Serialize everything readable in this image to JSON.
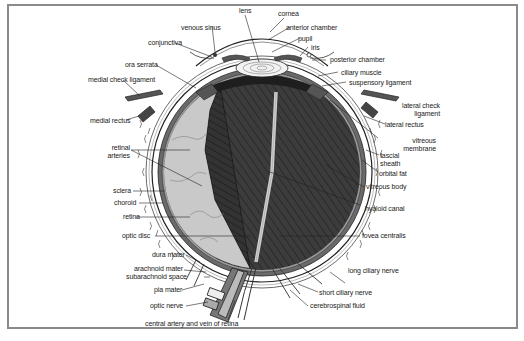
{
  "colors": {
    "frame": "#8a8a8a",
    "vitreous": "#3c3c3c",
    "sclera": "#ffffff",
    "choroid": "#6a6a6a",
    "retina": "#c8c8c8",
    "lens": "#ececec",
    "line": "#222222"
  },
  "labels": {
    "lens": "lens",
    "cornea": "cornea",
    "venous_sinus": "venous sinus",
    "anterior_chamber": "anterior chamber",
    "conjunctiva": "conjunctiva",
    "pupil": "pupil",
    "iris": "iris",
    "posterior_chamber": "posterior chamber",
    "ora_serrata": "ora serrata",
    "ciliary_muscle": "ciliary muscle",
    "medial_check_ligament": "medial check ligament",
    "suspensory_ligament": "suspensory ligament",
    "medial_rectus": "medial rectus",
    "lateral_check_ligament_1": "lateral check",
    "lateral_check_ligament_2": "ligament",
    "lateral_rectus": "lateral rectus",
    "retinal_arteries_1": "retinal",
    "retinal_arteries_2": "arteries",
    "vitreous_membrane_1": "vitreous",
    "vitreous_membrane_2": "membrane",
    "fascial_sheath_1": "fascial",
    "fascial_sheath_2": "sheath",
    "orbital_fat": "orbital fat",
    "sclera": "sclera",
    "choroid": "choroid",
    "vitreous_body": "vitreous body",
    "retina": "retina",
    "hyaloid_canal": "hyaloid canal",
    "optic_disc": "optic disc",
    "fovea_centralis": "fovea centralis",
    "dura_mater": "dura mater",
    "arachnoid_mater": "arachnoid mater",
    "subarachnoid_space": "subarachnoid space",
    "long_ciliary_nerve": "long ciliary nerve",
    "pia_mater": "pia mater",
    "short_ciliary_nerve": "short ciliary nerve",
    "optic_nerve": "optic nerve",
    "cerebrospinal_fluid": "cerebrospinal fluid",
    "central_artery_vein": "central artery and vein of retina"
  }
}
